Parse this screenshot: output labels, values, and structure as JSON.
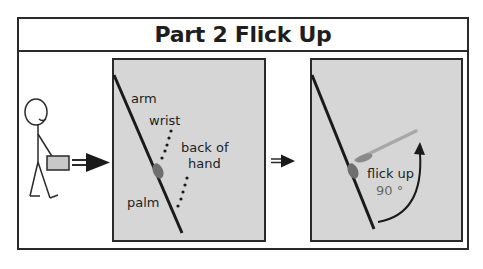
{
  "title": "Part 2 Flick Up",
  "panel_left": {
    "labels": {
      "arm": "arm",
      "wrist": "wrist",
      "back_of_hand_line1": "back of",
      "back_of_hand_line2": "hand",
      "palm": "palm"
    }
  },
  "panel_right": {
    "labels": {
      "action": "flick up",
      "angle": "90 °"
    }
  },
  "colors": {
    "panel_fill": "#d6d6d6",
    "line": "#1a1a1a",
    "wrist_blob": "#6e6e6e",
    "hand_flick": "#a8a8a8"
  }
}
